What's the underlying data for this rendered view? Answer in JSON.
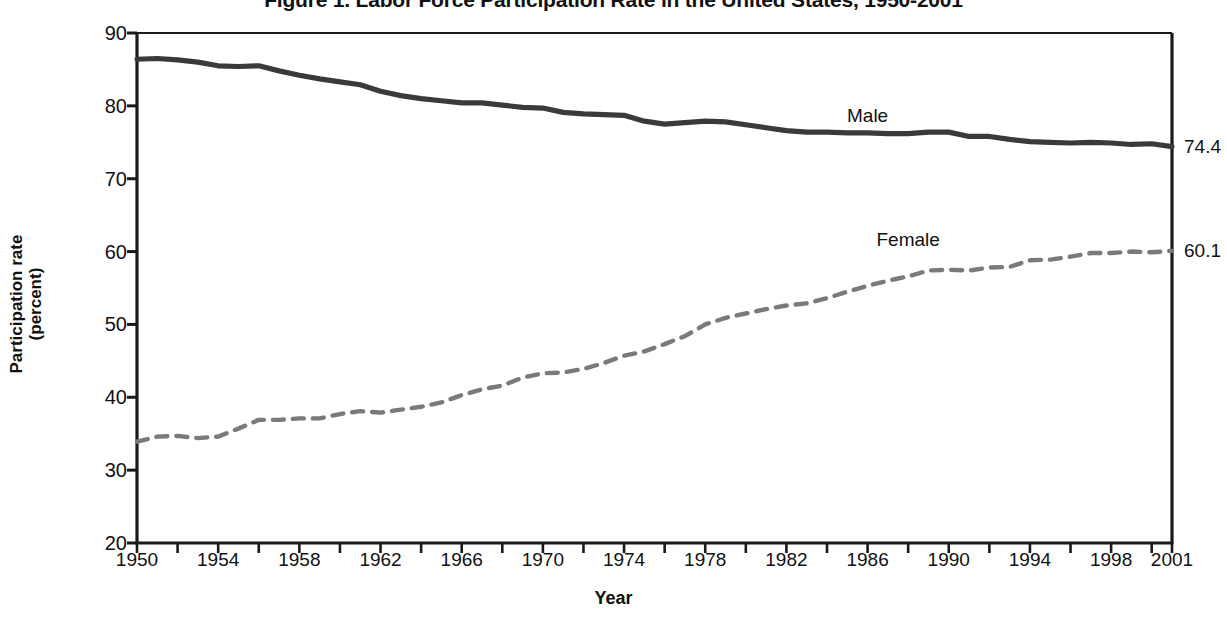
{
  "chart_data": {
    "type": "line",
    "title": "Figure 1. Labor Force Participation Rate in the United States, 1950-2001",
    "xlabel": "Year",
    "ylabel_line1": "Participation rate",
    "ylabel_line2": "(percent)",
    "xlim": [
      1950,
      2001
    ],
    "ylim": [
      20,
      90
    ],
    "ytick_values": [
      20,
      30,
      40,
      50,
      60,
      70,
      80,
      90
    ],
    "ytick_labels": [
      "20",
      "30",
      "40",
      "50",
      "60",
      "70",
      "80",
      "90"
    ],
    "xtick_labels": [
      "1950",
      "1954",
      "1958",
      "1962",
      "1966",
      "1970",
      "1974",
      "1978",
      "1982",
      "1986",
      "1990",
      "1994",
      "1998",
      "2001"
    ],
    "xtick_values": [
      1950,
      1954,
      1958,
      1962,
      1966,
      1970,
      1974,
      1978,
      1982,
      1986,
      1990,
      1994,
      1998,
      2001
    ],
    "minor_xtick_step": 2,
    "grid": false,
    "legend_position": "inline-annotation",
    "x": [
      1950,
      1951,
      1952,
      1953,
      1954,
      1955,
      1956,
      1957,
      1958,
      1959,
      1960,
      1961,
      1962,
      1963,
      1964,
      1965,
      1966,
      1967,
      1968,
      1969,
      1970,
      1971,
      1972,
      1973,
      1974,
      1975,
      1976,
      1977,
      1978,
      1979,
      1980,
      1981,
      1982,
      1983,
      1984,
      1985,
      1986,
      1987,
      1988,
      1989,
      1990,
      1991,
      1992,
      1993,
      1994,
      1995,
      1996,
      1997,
      1998,
      1999,
      2000,
      2001
    ],
    "series": [
      {
        "name": "Male",
        "style": "solid",
        "color": "#3a3a3a",
        "end_value_label": "74.4",
        "annotation": "Male",
        "annotation_x": 1986,
        "annotation_y": 78.6,
        "values": [
          86.4,
          86.5,
          86.3,
          86.0,
          85.5,
          85.4,
          85.5,
          84.8,
          84.2,
          83.7,
          83.3,
          82.9,
          82.0,
          81.4,
          81.0,
          80.7,
          80.4,
          80.4,
          80.1,
          79.8,
          79.7,
          79.1,
          78.9,
          78.8,
          78.7,
          77.9,
          77.5,
          77.7,
          77.9,
          77.8,
          77.4,
          77.0,
          76.6,
          76.4,
          76.4,
          76.3,
          76.3,
          76.2,
          76.2,
          76.4,
          76.4,
          75.8,
          75.8,
          75.4,
          75.1,
          75.0,
          74.9,
          75.0,
          74.9,
          74.7,
          74.8,
          74.4
        ]
      },
      {
        "name": "Female",
        "style": "dashed",
        "color": "#7a7a7a",
        "end_value_label": "60.1",
        "annotation": "Female",
        "annotation_x": 1988,
        "annotation_y": 61.6,
        "values": [
          33.9,
          34.6,
          34.7,
          34.4,
          34.6,
          35.7,
          36.9,
          36.9,
          37.1,
          37.1,
          37.7,
          38.1,
          37.9,
          38.3,
          38.7,
          39.3,
          40.3,
          41.1,
          41.6,
          42.7,
          43.3,
          43.4,
          43.9,
          44.7,
          45.7,
          46.3,
          47.3,
          48.4,
          50.0,
          50.9,
          51.5,
          52.1,
          52.6,
          52.9,
          53.6,
          54.5,
          55.3,
          56.0,
          56.6,
          57.4,
          57.5,
          57.4,
          57.8,
          57.9,
          58.8,
          58.9,
          59.3,
          59.8,
          59.8,
          60.0,
          59.9,
          60.1
        ]
      }
    ]
  }
}
